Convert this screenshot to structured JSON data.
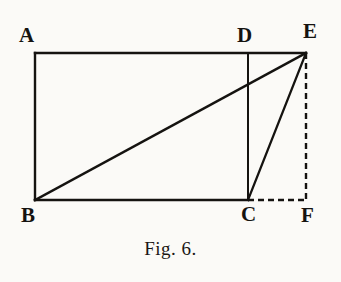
{
  "figure": {
    "caption": "Fig. 6.",
    "background_color": "#fbfaf7",
    "ink_color": "#151310",
    "labels": {
      "A": "A",
      "B": "B",
      "C": "C",
      "D": "D",
      "E": "E",
      "F": "F"
    }
  },
  "chart_data": {
    "type": "diagram",
    "title": "Fig. 6.",
    "points": [
      {
        "name": "A",
        "x": 35,
        "y": 53,
        "label": "A",
        "label_x": 19,
        "label_y": 25
      },
      {
        "name": "B",
        "x": 35,
        "y": 200,
        "label": "B",
        "label_x": 21,
        "label_y": 205
      },
      {
        "name": "C",
        "x": 248,
        "y": 200,
        "label": "C",
        "label_x": 241,
        "label_y": 204
      },
      {
        "name": "D",
        "x": 248,
        "y": 53,
        "label": "D",
        "label_x": 237,
        "label_y": 25
      },
      {
        "name": "E",
        "x": 306,
        "y": 53,
        "label": "E",
        "label_x": 303,
        "label_y": 21
      },
      {
        "name": "F",
        "x": 306,
        "y": 200,
        "label": "F",
        "label_x": 301,
        "label_y": 205
      }
    ],
    "segments": [
      {
        "name": "A-E",
        "from": "A",
        "to": "E",
        "style": "solid",
        "x1": 35,
        "y1": 53,
        "x2": 306,
        "y2": 53
      },
      {
        "name": "A-B",
        "from": "A",
        "to": "B",
        "style": "solid",
        "x1": 35,
        "y1": 53,
        "x2": 35,
        "y2": 200
      },
      {
        "name": "B-C",
        "from": "B",
        "to": "C",
        "style": "solid",
        "x1": 35,
        "y1": 200,
        "x2": 248,
        "y2": 200
      },
      {
        "name": "D-C",
        "from": "D",
        "to": "C",
        "style": "solid",
        "x1": 248,
        "y1": 53,
        "x2": 248,
        "y2": 200
      },
      {
        "name": "B-E",
        "from": "B",
        "to": "E",
        "style": "solid",
        "x1": 35,
        "y1": 200,
        "x2": 306,
        "y2": 53
      },
      {
        "name": "C-E",
        "from": "C",
        "to": "E",
        "style": "solid",
        "x1": 248,
        "y1": 200,
        "x2": 306,
        "y2": 53
      },
      {
        "name": "C-F",
        "from": "C",
        "to": "F",
        "style": "dashed",
        "x1": 248,
        "y1": 200,
        "x2": 306,
        "y2": 200
      },
      {
        "name": "E-F",
        "from": "E",
        "to": "F",
        "style": "dashed",
        "x1": 306,
        "y1": 53,
        "x2": 306,
        "y2": 200
      }
    ],
    "xlim": [
      0,
      341
    ],
    "ylim": [
      0,
      282
    ],
    "grid": false,
    "legend": null
  }
}
